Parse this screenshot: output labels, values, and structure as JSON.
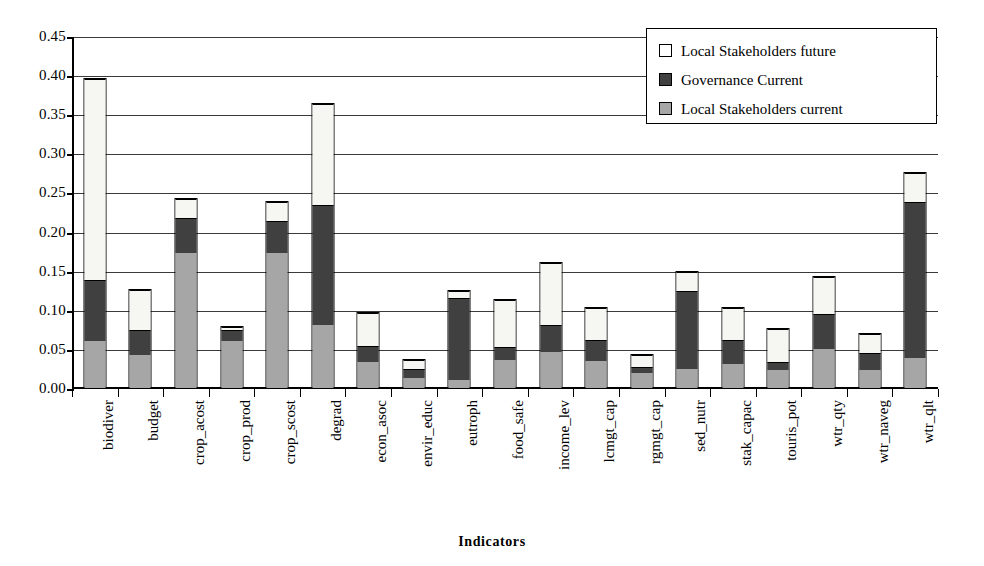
{
  "chart_data": {
    "type": "bar",
    "stacked": true,
    "title": "",
    "xlabel": "Indicators",
    "ylabel": "",
    "ylim": [
      0.0,
      0.45
    ],
    "ytick_step": 0.05,
    "ytick_labels": [
      "0.45",
      "0.40",
      "0.35",
      "0.30",
      "0.25",
      "0.20",
      "0.15",
      "0.10",
      "0.05",
      "0.00"
    ],
    "grid": true,
    "legend_position": "top-right",
    "categories": [
      "biodiver",
      "budget",
      "crop_acost",
      "crop_prod",
      "crop_scost",
      "degrad",
      "econ_asoc",
      "envir_educ",
      "eutroph",
      "food_safe",
      "income_lev",
      "lcmgt_cap",
      "rgmgt_cap",
      "sed_nutr",
      "stak_capac",
      "touris_pot",
      "wtr_qty",
      "wtr_naveg",
      "wtr_qlt"
    ],
    "series": [
      {
        "name": "Local Stakeholders current",
        "color": "#a6a6a6",
        "values": [
          0.06,
          0.043,
          0.174,
          0.062,
          0.174,
          0.081,
          0.034,
          0.014,
          0.011,
          0.036,
          0.047,
          0.035,
          0.021,
          0.025,
          0.032,
          0.024,
          0.051,
          0.024,
          0.039
        ]
      },
      {
        "name": "Governance Current",
        "color": "#404040",
        "values": [
          0.079,
          0.033,
          0.046,
          0.015,
          0.042,
          0.155,
          0.021,
          0.012,
          0.107,
          0.018,
          0.035,
          0.028,
          0.008,
          0.101,
          0.031,
          0.011,
          0.045,
          0.023,
          0.201
        ]
      },
      {
        "name": "Local Stakeholders future",
        "color": "#ffffff",
        "values": [
          0.259,
          0.052,
          0.024,
          0.003,
          0.025,
          0.13,
          0.043,
          0.012,
          0.008,
          0.061,
          0.08,
          0.042,
          0.016,
          0.025,
          0.042,
          0.043,
          0.049,
          0.024,
          0.037
        ]
      }
    ],
    "totals": [
      0.398,
      0.128,
      0.244,
      0.08,
      0.241,
      0.366,
      0.098,
      0.038,
      0.126,
      0.115,
      0.162,
      0.105,
      0.045,
      0.151,
      0.105,
      0.078,
      0.145,
      0.071,
      0.277
    ]
  },
  "legend": {
    "items": [
      {
        "label": "Local Stakeholders future",
        "swatch": "white-swatch-icon"
      },
      {
        "label": "Governance Current",
        "swatch": "dark-swatch-icon"
      },
      {
        "label": "Local Stakeholders current",
        "swatch": "gray-swatch-icon"
      }
    ]
  },
  "axis": {
    "x_title": "Indicators"
  }
}
